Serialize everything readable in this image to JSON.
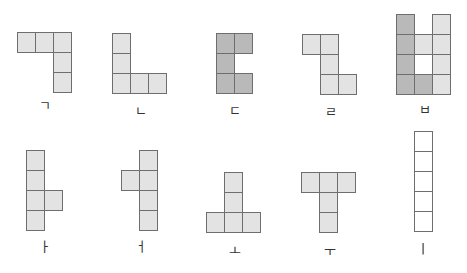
{
  "diagram": {
    "cell_size": {
      "w": 19,
      "h": 21
    },
    "colors": {
      "light": "#e3e3e3",
      "dark": "#b9b9b9",
      "white": "#ffffff",
      "border": "#6e6e6e"
    },
    "figures": [
      {
        "label": "ㄱ",
        "x": 17,
        "y": 32,
        "label_x": 30,
        "label_y": 99,
        "cells": [
          [
            0,
            0,
            "light"
          ],
          [
            1,
            0,
            "light"
          ],
          [
            2,
            0,
            "light"
          ],
          [
            2,
            1,
            "light"
          ],
          [
            2,
            2,
            "light"
          ]
        ]
      },
      {
        "label": "ㄴ",
        "x": 112,
        "y": 33,
        "label_x": 126,
        "label_y": 104,
        "cells": [
          [
            0,
            0,
            "light"
          ],
          [
            0,
            1,
            "light"
          ],
          [
            0,
            2,
            "light"
          ],
          [
            1,
            2,
            "light"
          ],
          [
            2,
            2,
            "light"
          ]
        ]
      },
      {
        "label": "ㄷ",
        "x": 216,
        "y": 33,
        "label_x": 220,
        "label_y": 104,
        "cells": [
          [
            0,
            0,
            "dark"
          ],
          [
            1,
            0,
            "dark"
          ],
          [
            0,
            1,
            "dark"
          ],
          [
            0,
            2,
            "dark"
          ],
          [
            1,
            2,
            "dark"
          ]
        ]
      },
      {
        "label": "ㄹ",
        "x": 302,
        "y": 34,
        "label_x": 316,
        "label_y": 105,
        "cells": [
          [
            0,
            0,
            "light"
          ],
          [
            1,
            0,
            "light"
          ],
          [
            1,
            1,
            "light"
          ],
          [
            1,
            2,
            "light"
          ],
          [
            2,
            2,
            "light"
          ]
        ]
      },
      {
        "label": "ㅂ",
        "x": 396,
        "y": 14,
        "label_x": 410,
        "label_y": 103,
        "cells": [
          [
            0,
            0,
            "dark"
          ],
          [
            2,
            0,
            "light"
          ],
          [
            0,
            1,
            "dark"
          ],
          [
            1,
            1,
            "light"
          ],
          [
            2,
            1,
            "light"
          ],
          [
            0,
            2,
            "dark"
          ],
          [
            1,
            2,
            "white"
          ],
          [
            2,
            2,
            "light"
          ],
          [
            0,
            3,
            "dark"
          ],
          [
            1,
            3,
            "dark"
          ],
          [
            2,
            3,
            "light"
          ]
        ]
      },
      {
        "label": "ㅏ",
        "x": 26,
        "y": 150,
        "label_x": 30,
        "label_y": 240,
        "cells": [
          [
            0,
            0,
            "light"
          ],
          [
            0,
            1,
            "light"
          ],
          [
            0,
            2,
            "light"
          ],
          [
            1,
            2,
            "light"
          ],
          [
            0,
            3,
            "light"
          ]
        ]
      },
      {
        "label": "ㅓ",
        "x": 121,
        "y": 150,
        "label_x": 126,
        "label_y": 240,
        "cells": [
          [
            1,
            0,
            "light"
          ],
          [
            0,
            1,
            "light"
          ],
          [
            1,
            1,
            "light"
          ],
          [
            1,
            2,
            "light"
          ],
          [
            1,
            3,
            "light"
          ]
        ]
      },
      {
        "label": "ㅗ",
        "x": 206,
        "y": 172,
        "label_x": 220,
        "label_y": 244,
        "cells": [
          [
            1,
            0,
            "light"
          ],
          [
            1,
            1,
            "light"
          ],
          [
            0,
            2,
            "light"
          ],
          [
            1,
            2,
            "light"
          ],
          [
            2,
            2,
            "light"
          ]
        ]
      },
      {
        "label": "ㅜ",
        "x": 301,
        "y": 172,
        "label_x": 315,
        "label_y": 244,
        "cells": [
          [
            0,
            0,
            "light"
          ],
          [
            1,
            0,
            "light"
          ],
          [
            2,
            0,
            "light"
          ],
          [
            1,
            1,
            "light"
          ],
          [
            1,
            2,
            "light"
          ]
        ]
      },
      {
        "label": "ㅣ",
        "x": 414,
        "y": 131,
        "label_x": 408,
        "label_y": 242,
        "cells": [
          [
            0,
            0,
            "white"
          ],
          [
            0,
            1,
            "white"
          ],
          [
            0,
            2,
            "white"
          ],
          [
            0,
            3,
            "white"
          ],
          [
            0,
            4,
            "white"
          ]
        ]
      }
    ]
  }
}
